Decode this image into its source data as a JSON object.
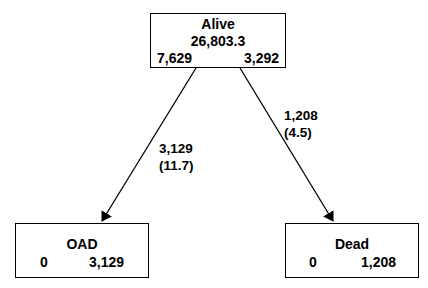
{
  "nodes": {
    "alive": {
      "title": "Alive",
      "total": "26,803.3",
      "left_value": "7,629",
      "right_value": "3,292"
    },
    "oad": {
      "title": "OAD",
      "left_value": "0",
      "right_value": "3,129"
    },
    "dead": {
      "title": "Dead",
      "left_value": "0",
      "right_value": "1,208"
    }
  },
  "edges": {
    "alive_to_oad": {
      "count": "3,129",
      "rate": "(11.7)"
    },
    "alive_to_dead": {
      "count": "1,208",
      "rate": "(4.5)"
    }
  }
}
